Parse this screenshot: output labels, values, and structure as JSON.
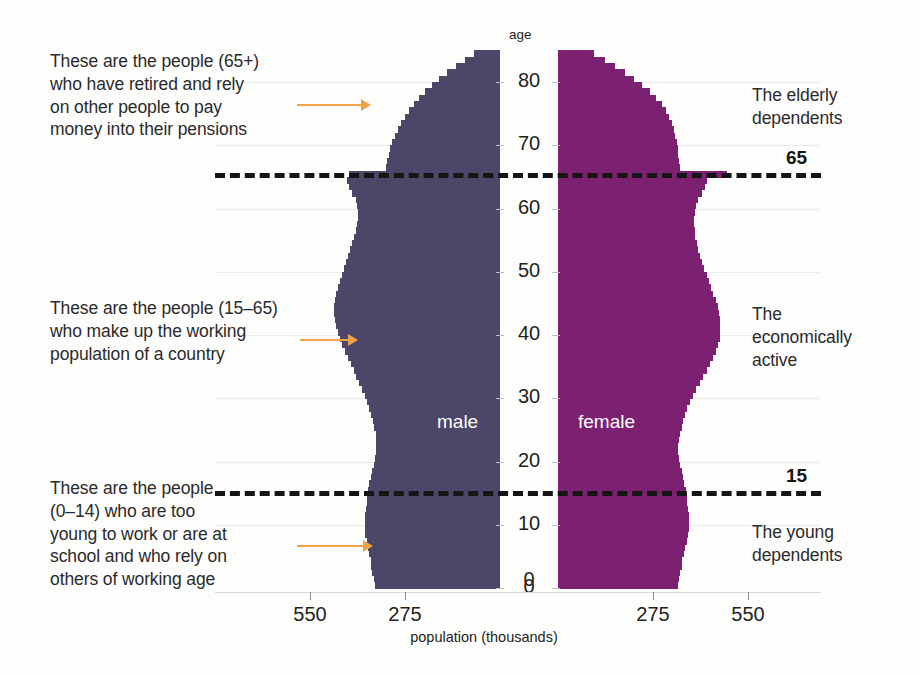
{
  "chart_data": {
    "type": "bar",
    "title": "",
    "subtitle": "",
    "orientation": "population-pyramid",
    "xlabel": "population (thousands)",
    "ylabel": "age",
    "xlim": [
      -550,
      550
    ],
    "ylim": [
      0,
      85
    ],
    "grid": true,
    "legend_position": "inline-on-bars",
    "x_tick_labels": [
      "550",
      "275",
      "0",
      "275",
      "550"
    ],
    "x_tick_values": [
      -550,
      -275,
      0,
      275,
      550
    ],
    "y_tick_labels": [
      "0",
      "10",
      "20",
      "30",
      "40",
      "50",
      "60",
      "70",
      "80"
    ],
    "y_tick_values": [
      0,
      10,
      20,
      30,
      40,
      50,
      60,
      70,
      80
    ],
    "ages": [
      0,
      1,
      2,
      3,
      4,
      5,
      6,
      7,
      8,
      9,
      10,
      11,
      12,
      13,
      14,
      15,
      16,
      17,
      18,
      19,
      20,
      21,
      22,
      23,
      24,
      25,
      26,
      27,
      28,
      29,
      30,
      31,
      32,
      33,
      34,
      35,
      36,
      37,
      38,
      39,
      40,
      41,
      42,
      43,
      44,
      45,
      46,
      47,
      48,
      49,
      50,
      51,
      52,
      53,
      54,
      55,
      56,
      57,
      58,
      59,
      60,
      61,
      62,
      63,
      64,
      65,
      66,
      67,
      68,
      69,
      70,
      71,
      72,
      73,
      74,
      75,
      76,
      77,
      78,
      79,
      80,
      81,
      82,
      83,
      84
    ],
    "series": [
      {
        "name": "male",
        "color": "#4c4669",
        "side": "left",
        "values": [
          362,
          366,
          370,
          372,
          374,
          378,
          382,
          386,
          390,
          392,
          392,
          390,
          388,
          386,
          384,
          382,
          378,
          374,
          370,
          366,
          362,
          360,
          358,
          358,
          360,
          364,
          368,
          372,
          378,
          384,
          392,
          400,
          408,
          416,
          424,
          432,
          440,
          448,
          456,
          462,
          468,
          474,
          478,
          480,
          480,
          478,
          474,
          470,
          464,
          458,
          452,
          446,
          440,
          434,
          428,
          422,
          418,
          414,
          412,
          412,
          414,
          418,
          428,
          438,
          444,
          436,
          330,
          326,
          322,
          318,
          312,
          304,
          296,
          286,
          276,
          264,
          250,
          234,
          216,
          196,
          176,
          152,
          128,
          102,
          76
        ]
      },
      {
        "name": "female",
        "color": "#7c2172",
        "side": "right",
        "values": [
          346,
          350,
          354,
          358,
          360,
          364,
          368,
          372,
          376,
          378,
          380,
          378,
          376,
          374,
          372,
          370,
          366,
          362,
          358,
          354,
          350,
          348,
          348,
          350,
          354,
          358,
          362,
          368,
          374,
          382,
          390,
          400,
          410,
          420,
          430,
          440,
          450,
          458,
          464,
          468,
          470,
          470,
          468,
          466,
          462,
          456,
          450,
          444,
          436,
          430,
          424,
          418,
          412,
          406,
          402,
          398,
          396,
          394,
          394,
          396,
          400,
          406,
          416,
          426,
          432,
          490,
          352,
          350,
          348,
          346,
          344,
          340,
          336,
          330,
          322,
          312,
          300,
          284,
          266,
          244,
          220,
          194,
          166,
          136,
          104
        ]
      }
    ]
  },
  "annotations": {
    "left": [
      {
        "id": "elderly",
        "text": "These are the people (65+)\nwho have retired and rely\non other people to pay\nmoney into their pensions",
        "arrow_color": "#f0a248"
      },
      {
        "id": "working",
        "text": "These are the people (15–65)\nwho make up the working\npopulation of a country",
        "arrow_color": "#f0a248"
      },
      {
        "id": "young",
        "text": "These are the people\n(0–14) who are too\nyoung to work or are at\nschool and who rely on\nothers of working age",
        "arrow_color": "#f0a248"
      }
    ],
    "right": [
      {
        "id": "elderly",
        "text": "The elderly\ndependents"
      },
      {
        "id": "active",
        "text": "The\neconomically\nactive"
      },
      {
        "id": "young",
        "text": "The young\ndependents"
      }
    ],
    "divider_lines": [
      {
        "id": "line65",
        "label": "65",
        "age": 65
      },
      {
        "id": "line15",
        "label": "15",
        "age": 15
      }
    ]
  },
  "axes": {
    "age_caption": "age",
    "population_caption": "population (thousands)"
  },
  "colors": {
    "male": "#4c4669",
    "female": "#7c2172",
    "arrow": "#f0a248",
    "divider": "#151515",
    "background": "#fdfdfc",
    "gridline": "#eceaea"
  }
}
